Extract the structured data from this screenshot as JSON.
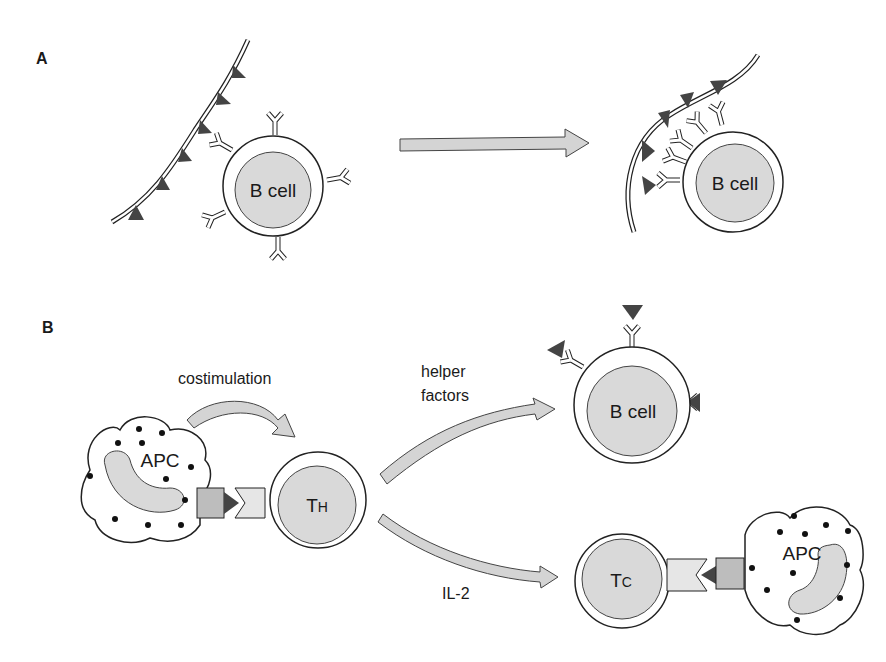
{
  "panels": {
    "a": {
      "label": "A",
      "left_cell": "B cell",
      "right_cell": "B cell"
    },
    "b": {
      "label": "B",
      "costimulation_label": "costimulation",
      "apc_left": "APC",
      "th_cell": "T",
      "th_sub": "H",
      "helper_label_line1": "helper",
      "helper_label_line2": "factors",
      "b_cell": "B cell",
      "il2_label": "IL-2",
      "tc_cell": "T",
      "tc_sub": "C",
      "apc_right": "APC"
    }
  },
  "colors": {
    "cell_nucleus": "#d9d9d9",
    "arrow_fill": "#d4d4d4",
    "antigen": "#444444",
    "outline": "#222222"
  }
}
